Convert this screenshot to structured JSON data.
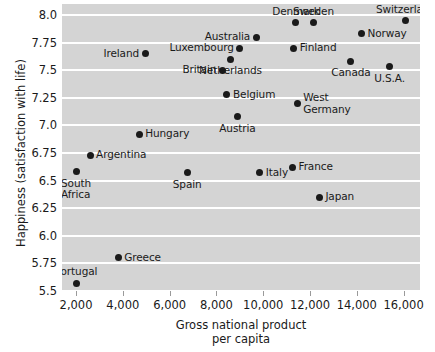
{
  "chart_data": {
    "type": "scatter",
    "title": "",
    "xlabel": "Gross national product\nper capita",
    "xlabel_line1": "Gross national product",
    "xlabel_line2": "per capita",
    "ylabel": "Happiness (satisfaction with life)",
    "xlim": [
      1400,
      16700
    ],
    "ylim": [
      5.5,
      8.1
    ],
    "grid": true,
    "legend": "none",
    "xticks": [
      2000,
      4000,
      6000,
      8000,
      10000,
      12000,
      14000,
      16000
    ],
    "xtick_labels": [
      "2,000",
      "4,000",
      "6,000",
      "8,000",
      "10,000",
      "12,000",
      "14,000",
      "16,000"
    ],
    "yticks": [
      5.5,
      5.75,
      6.0,
      6.25,
      6.5,
      6.75,
      7.0,
      7.25,
      7.5,
      7.75,
      8.0
    ],
    "ytick_labels": [
      "5.5",
      "5.75",
      "6.0",
      "6.25",
      "6.5",
      "6.75",
      "7.0",
      "7.25",
      "7.5",
      "7.75",
      "8.0"
    ],
    "plot_background": "#d4d4d4",
    "gridline_color": "#ffffff",
    "point_color": "#1a1a1a",
    "points": [
      {
        "label": "Switzerland",
        "x": 16100,
        "y": 7.95,
        "label_pos": "ct"
      },
      {
        "label": "Denmark",
        "x": 11400,
        "y": 7.93,
        "label_pos": "ct"
      },
      {
        "label": "Sweden",
        "x": 12150,
        "y": 7.93,
        "label_pos": "ct"
      },
      {
        "label": "Norway",
        "x": 14200,
        "y": 7.83,
        "label_pos": "lr"
      },
      {
        "label": "Australia",
        "x": 9700,
        "y": 7.8,
        "label_pos": "rl"
      },
      {
        "label": "Luxembourg",
        "x": 9000,
        "y": 7.7,
        "label_pos": "rl"
      },
      {
        "label": "Finland",
        "x": 11300,
        "y": 7.7,
        "label_pos": "lr"
      },
      {
        "label": "Ireland",
        "x": 4950,
        "y": 7.65,
        "label_pos": "rl"
      },
      {
        "label": "Netherlands",
        "x": 8600,
        "y": 7.6,
        "label_pos": "cb"
      },
      {
        "label": "Canada",
        "x": 13750,
        "y": 7.58,
        "label_pos": "cb"
      },
      {
        "label": "U.S.A.",
        "x": 15400,
        "y": 7.53,
        "label_pos": "cb"
      },
      {
        "label": "Britain",
        "x": 8250,
        "y": 7.5,
        "label_pos": "rl"
      },
      {
        "label": "Belgium",
        "x": 8450,
        "y": 7.28,
        "label_pos": "lr"
      },
      {
        "label": "West\nGermany",
        "x": 11450,
        "y": 7.2,
        "label_pos": "lr"
      },
      {
        "label": "Austria",
        "x": 8900,
        "y": 7.08,
        "label_pos": "cb"
      },
      {
        "label": "Hungary",
        "x": 4700,
        "y": 6.92,
        "label_pos": "lr"
      },
      {
        "label": "Argentina",
        "x": 2600,
        "y": 6.73,
        "label_pos": "lr"
      },
      {
        "label": "South\nAfrica",
        "x": 2000,
        "y": 6.58,
        "label_pos": "cb"
      },
      {
        "label": "Spain",
        "x": 6750,
        "y": 6.57,
        "label_pos": "cb"
      },
      {
        "label": "Italy",
        "x": 9850,
        "y": 6.57,
        "label_pos": "lr"
      },
      {
        "label": "France",
        "x": 11250,
        "y": 6.62,
        "label_pos": "lr"
      },
      {
        "label": "Japan",
        "x": 12400,
        "y": 6.35,
        "label_pos": "lr"
      },
      {
        "label": "Greece",
        "x": 3800,
        "y": 5.8,
        "label_pos": "lr"
      },
      {
        "label": "Portugal",
        "x": 2000,
        "y": 5.57,
        "label_pos": "ct"
      }
    ]
  }
}
